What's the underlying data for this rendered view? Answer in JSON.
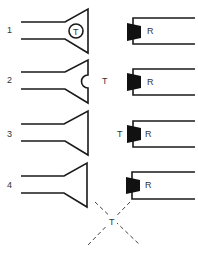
{
  "diagram": {
    "rows": [
      {
        "number": "1",
        "transmitter_label": "T",
        "transmitter_position": "inside horn (circle)",
        "receiver_label": "R"
      },
      {
        "number": "2",
        "transmitter_label": "T",
        "transmitter_position": "gap between horn and receiver",
        "receiver_label": "R"
      },
      {
        "number": "3",
        "transmitter_label": "T",
        "transmitter_position": "beside receiver driver",
        "receiver_label": "R"
      },
      {
        "number": "4",
        "transmitter_label": "T",
        "transmitter_position": "below, at crossing of dashed lines",
        "receiver_label": "R"
      }
    ],
    "colors": {
      "ink": "#1a1a1a",
      "label": "#333333",
      "background": "#ffffff"
    }
  }
}
